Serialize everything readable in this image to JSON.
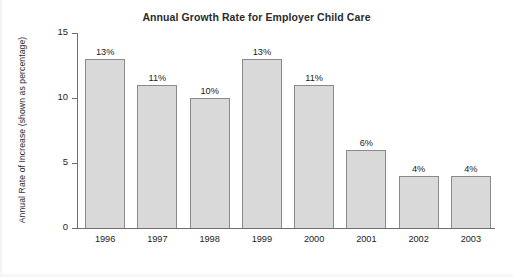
{
  "chart_data": {
    "type": "bar",
    "title": "Annual Growth Rate for Employer Child Care",
    "xlabel": "",
    "ylabel": "Annual Rate of Increase (shown as percentage)",
    "categories": [
      "1996",
      "1997",
      "1998",
      "1999",
      "2000",
      "2001",
      "2002",
      "2003"
    ],
    "values": [
      13,
      11,
      10,
      13,
      11,
      6,
      4,
      4
    ],
    "value_labels": [
      "13%",
      "11%",
      "10%",
      "13%",
      "11%",
      "6%",
      "4%",
      "4%"
    ],
    "ylim": [
      0,
      15
    ],
    "yticks": [
      0,
      5,
      10,
      15
    ],
    "ytick_labels": [
      "0",
      "5",
      "10",
      "15"
    ],
    "grid": false,
    "legend": null,
    "bar_fill_color": "#d9d9d9",
    "bar_border_color": "#8a8a8a",
    "axis_color": "#6e6e6e",
    "text_color": "#232323",
    "background_color": "#ffffff"
  }
}
